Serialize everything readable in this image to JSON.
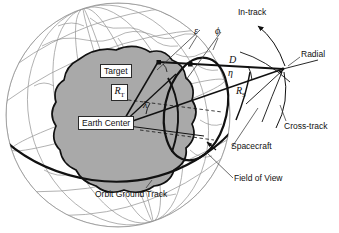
{
  "figure": {
    "background_color": "#ffffff",
    "width": 339,
    "height": 233
  },
  "colors": {
    "earth_shade": "#a9a9a9",
    "grid_line": "#9a9a9a",
    "coast_line": "#8c8c8c",
    "heavy_line": "#111111",
    "leader_line": "#3a3a3a",
    "text": "#111111"
  },
  "labels": {
    "target": "Target",
    "earth_center": "Earth Center",
    "spacecraft": "Spacecraft",
    "field_of_view": "Field of View",
    "orbit_ground_track": "Orbit Ground Track",
    "in_track": "In-track",
    "radial": "Radial",
    "cross_track": "Cross-track"
  },
  "symbols": {
    "epsilon": "ε",
    "phi": "ϕ",
    "eta": "η",
    "lambda": "λ",
    "distance_D": "D",
    "radius_target": "R",
    "radius_target_sub": "T",
    "radius_spacecraft": "R",
    "radius_spacecraft_sub": "S"
  },
  "symbol_meanings": {
    "epsilon": "spacecraft elevation angle at target",
    "phi": "azimuth / earth central angle reference",
    "eta": "nadir angle at spacecraft",
    "lambda": "earth central angle at earth center",
    "D": "slant range from spacecraft to target",
    "R_T": "radius from earth center to target",
    "R_S": "radius from earth center to spacecraft"
  },
  "axes": {
    "items": [
      {
        "name": "in-track",
        "label": "In-track"
      },
      {
        "name": "radial",
        "label": "Radial"
      },
      {
        "name": "cross-track",
        "label": "Cross-track"
      }
    ]
  }
}
